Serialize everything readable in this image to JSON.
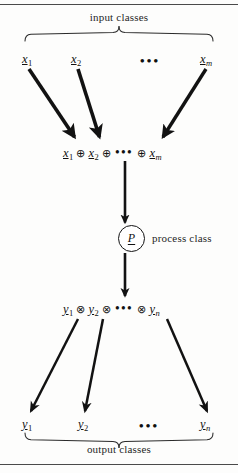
{
  "figure": {
    "title_top": "input classes",
    "title_bottom": "output classes",
    "process_label": "process class",
    "ellipsis": "•••",
    "colors": {
      "ink": "#111111",
      "rule": "#4a4a4a",
      "background": "#fdfdfc"
    }
  },
  "input_row": {
    "label": "input classes",
    "items": [
      {
        "name": "x-1",
        "base": "x",
        "sub": "1",
        "sub_italic": false
      },
      {
        "name": "x-2",
        "base": "x",
        "sub": "2",
        "sub_italic": false
      },
      {
        "name": "x-ellipsis",
        "base": "•••",
        "sub": "",
        "sub_italic": false
      },
      {
        "name": "x-m",
        "base": "x",
        "sub": "m",
        "sub_italic": true
      }
    ]
  },
  "input_sum": {
    "operator": "⊕",
    "ellipsis": "•••",
    "terms": [
      {
        "base": "x",
        "sub": "1",
        "sub_italic": false
      },
      {
        "base": "x",
        "sub": "2",
        "sub_italic": false
      },
      {
        "base": "x",
        "sub": "m",
        "sub_italic": true
      }
    ],
    "expression": "x1 ⊕ x2 ⊕ ••• ⊕ xm"
  },
  "process": {
    "symbol": "P",
    "label": "process class"
  },
  "output_sum": {
    "operator": "⊗",
    "ellipsis": "•••",
    "terms": [
      {
        "base": "y",
        "sub": "1",
        "sub_italic": false
      },
      {
        "base": "y",
        "sub": "2",
        "sub_italic": false
      },
      {
        "base": "y",
        "sub": "n",
        "sub_italic": true
      }
    ],
    "expression": "y1 ⊗ y2 ⊗ ••• ⊗ yn"
  },
  "output_row": {
    "label": "output classes",
    "items": [
      {
        "name": "y-1",
        "base": "y",
        "sub": "1",
        "sub_italic": false
      },
      {
        "name": "y-2",
        "base": "y",
        "sub": "2",
        "sub_italic": false
      },
      {
        "name": "y-ellipsis",
        "base": "•••",
        "sub": "",
        "sub_italic": false
      },
      {
        "name": "y-n",
        "base": "y",
        "sub": "n",
        "sub_italic": true
      }
    ]
  }
}
